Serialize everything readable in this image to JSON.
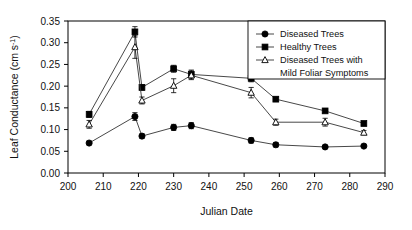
{
  "figure": {
    "title": "",
    "background_color": "#ffffff",
    "frame_color": "#000000"
  },
  "axes": {
    "x": {
      "label": "Julian Date",
      "ticks": [
        200,
        210,
        220,
        230,
        240,
        250,
        260,
        270,
        280,
        290
      ],
      "tick_labels": [
        "200",
        "210",
        "220",
        "230",
        "240",
        "250",
        "260",
        "270",
        "280",
        "290"
      ],
      "min": 200,
      "max": 290
    },
    "y": {
      "label_main": "Leaf Conductance (cm s",
      "label_sup": "-1",
      "label_tail": ")",
      "label_full": "Leaf Conductance (cm s-1)",
      "ticks": [
        0.0,
        0.05,
        0.1,
        0.15,
        0.2,
        0.25,
        0.3,
        0.35
      ],
      "tick_labels": [
        "0.00",
        "0.05",
        "0.10",
        "0.15",
        "0.20",
        "0.25",
        "0.30",
        "0.35"
      ],
      "min": 0.0,
      "max": 0.35
    }
  },
  "legend": {
    "position": "upper-right",
    "entries": [
      {
        "label": "Diseased Trees",
        "marker": "filled-circle"
      },
      {
        "label": "Healthy Trees",
        "marker": "filled-square"
      },
      {
        "label": "Diseased Trees with",
        "label2": "Mild Foliar Symptoms",
        "marker": "open-triangle"
      }
    ]
  },
  "chart_data": {
    "type": "line",
    "title": "",
    "xlabel": "Julian Date",
    "ylabel": "Leaf Conductance (cm s-1)",
    "xlim": [
      200,
      290
    ],
    "ylim": [
      0.0,
      0.35
    ],
    "grid": false,
    "legend_position": "upper right",
    "x": [
      206,
      219,
      221,
      230,
      235,
      252,
      259,
      273,
      284
    ],
    "series": [
      {
        "name": "Diseased Trees",
        "marker": "filled-circle",
        "values": [
          0.069,
          0.13,
          0.085,
          0.105,
          0.109,
          0.075,
          0.065,
          0.06,
          0.062
        ],
        "errors": [
          0.004,
          0.009,
          0.005,
          0.007,
          0.007,
          0.006,
          0.005,
          0.003,
          0.003
        ]
      },
      {
        "name": "Healthy Trees",
        "marker": "filled-square",
        "values": [
          0.135,
          0.325,
          0.197,
          0.24,
          0.227,
          0.218,
          0.17,
          0.143,
          0.114
        ],
        "errors": [
          0.007,
          0.012,
          0.006,
          0.008,
          0.01,
          0.008,
          0.005,
          0.004,
          0.004
        ]
      },
      {
        "name": "Diseased Trees with Mild Foliar Symptoms",
        "marker": "open-triangle",
        "values": [
          0.112,
          0.29,
          0.167,
          0.201,
          0.225,
          0.185,
          0.117,
          0.117,
          0.093
        ],
        "errors": [
          0.009,
          0.026,
          0.008,
          0.016,
          0.01,
          0.012,
          0.007,
          0.009,
          0.005
        ]
      }
    ]
  }
}
